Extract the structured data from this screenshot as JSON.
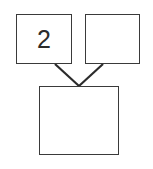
{
  "diagram": {
    "background_color": "#ffffff",
    "stroke_color": "#3a3a3a",
    "text_color": "#2b2b2b",
    "nodes": [
      {
        "id": "parent-left",
        "label": "2",
        "x": 16,
        "y": 14,
        "width": 56,
        "height": 50,
        "filled": false
      },
      {
        "id": "parent-right",
        "label": "",
        "x": 85,
        "y": 14,
        "width": 55,
        "height": 50,
        "filled": false
      },
      {
        "id": "child-bottom",
        "label": "",
        "x": 39,
        "y": 86,
        "width": 80,
        "height": 69,
        "filled": false
      }
    ],
    "edges": [
      {
        "id": "edge-left-to-child",
        "from": "parent-left",
        "to": "child-bottom",
        "x1": 55,
        "y1": 64,
        "x2": 79,
        "y2": 86
      },
      {
        "id": "edge-right-to-child",
        "from": "parent-right",
        "to": "child-bottom",
        "x1": 103,
        "y1": 64,
        "x2": 79,
        "y2": 86
      }
    ]
  }
}
